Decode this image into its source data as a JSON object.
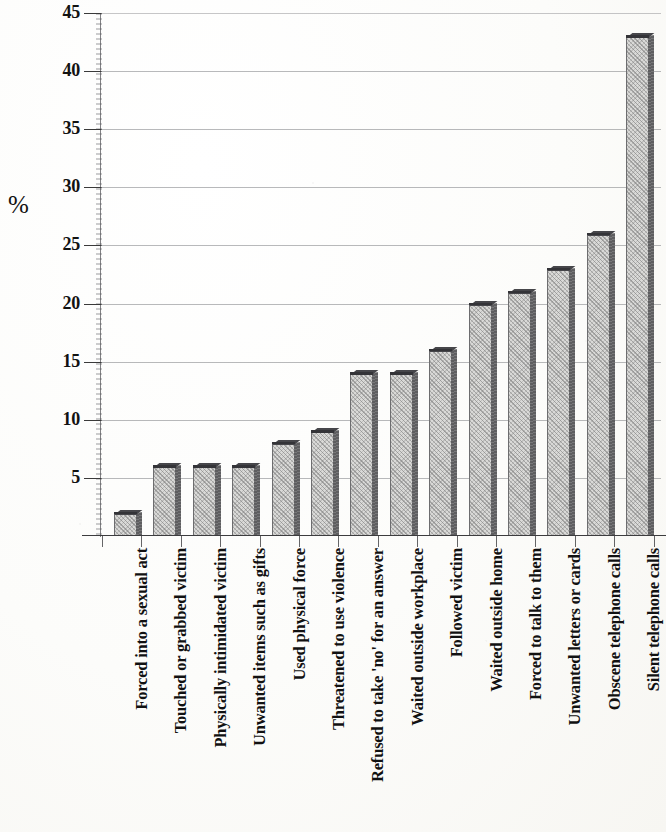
{
  "axis": {
    "y_label": "%",
    "y_ticks": [
      "5",
      "10",
      "15",
      "20",
      "25",
      "30",
      "35",
      "40",
      "45"
    ]
  },
  "chart_data": {
    "type": "bar",
    "title": "",
    "subtitle": "",
    "xlabel": "",
    "ylabel": "%",
    "ylim": [
      0,
      45
    ],
    "ytick_step": 5,
    "grid": true,
    "legend": "none",
    "orientation": "vertical",
    "style": "3d-bar",
    "categories": [
      "Forced into a sexual act",
      "Touched or grabbed victim",
      "Physically intimidated victim",
      "Unwanted items such as gifts",
      "Used physical force",
      "Threatened to use violence",
      "Refused to take 'no' for an answer",
      "Waited outside workplace",
      "Followed victim",
      "Waited outside home",
      "Forced to talk to them",
      "Unwanted letters or cards",
      "Obscene telephone calls",
      "Silent telephone calls"
    ],
    "values": [
      2,
      6,
      6,
      6,
      8,
      9,
      14,
      14,
      16,
      20,
      21,
      23,
      26,
      43
    ]
  },
  "colors": {
    "bar_face": "#d9d9d7",
    "bar_side": "#5e5e60",
    "bar_top": "#46464a",
    "gridline": "#8d8e92",
    "axis": "#3c3c3e",
    "text": "#111111",
    "background": "#fdfdfb"
  }
}
